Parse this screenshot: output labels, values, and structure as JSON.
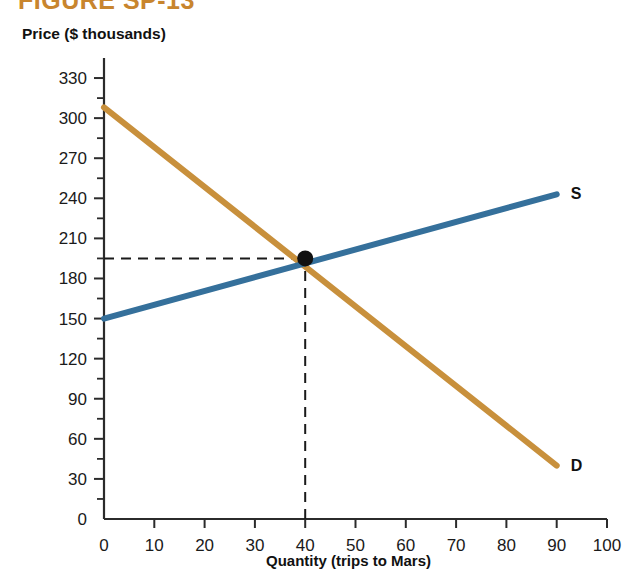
{
  "figure": {
    "number_label": "FIGURE SP-13",
    "number_color": "#C8852E"
  },
  "axes": {
    "y_title": "Price ($ thousands)",
    "x_title": "Quantity (trips to Mars)"
  },
  "chart_data": {
    "type": "line",
    "title": "FIGURE SP-13",
    "xlabel": "Quantity (trips to Mars)",
    "ylabel": "Price ($ thousands)",
    "xlim": [
      0,
      100
    ],
    "ylim": [
      0,
      345
    ],
    "grid": false,
    "legend": "inline-curve-labels",
    "x_ticks": [
      0,
      10,
      20,
      30,
      40,
      50,
      60,
      70,
      80,
      90,
      100
    ],
    "x_tick_labels": [
      "0",
      "10",
      "20",
      "30",
      "40",
      "50",
      "60",
      "70",
      "80",
      "90",
      "100"
    ],
    "x_minor_tick_step": 5,
    "y_ticks": [
      0,
      30,
      60,
      90,
      120,
      150,
      180,
      210,
      240,
      270,
      300,
      330
    ],
    "y_tick_labels": [
      "0",
      "30",
      "60",
      "90",
      "120",
      "150",
      "180",
      "210",
      "240",
      "270",
      "300",
      "330"
    ],
    "y_minor_tick_step": 15,
    "series": [
      {
        "name": "D",
        "label": "D",
        "description": "Demand curve",
        "color": "#C8903C",
        "x": [
          0,
          90
        ],
        "values": [
          308,
          40
        ]
      },
      {
        "name": "S",
        "label": "S",
        "description": "Supply curve",
        "color": "#35709B",
        "x": [
          0,
          90
        ],
        "values": [
          150,
          243
        ]
      }
    ],
    "annotations": [
      {
        "name": "equilibrium-point",
        "type": "point",
        "x": 40,
        "y": 195,
        "color": "#111111"
      },
      {
        "name": "equilibrium-price-guide",
        "type": "dashed-horizontal",
        "y": 195,
        "x_from": 0,
        "x_to": 40
      },
      {
        "name": "equilibrium-quantity-guide",
        "type": "dashed-vertical",
        "x": 40,
        "y_from": 0,
        "y_to": 195
      }
    ]
  }
}
